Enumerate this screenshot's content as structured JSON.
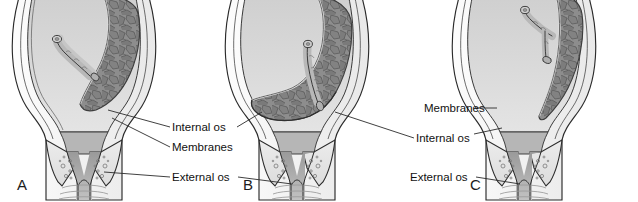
{
  "figure": {
    "background_color": "#ffffff",
    "panels": [
      {
        "letter": "A",
        "name": "low-lying-placenta",
        "placenta_position": "upper right uterine wall, does not reach internal os"
      },
      {
        "letter": "B",
        "name": "partial-placenta-previa",
        "placenta_position": "lower uterine segment, partially covering internal os"
      },
      {
        "letter": "C",
        "name": "marginal-placenta-previa",
        "placenta_position": "right lateral wall, edge near lower segment"
      }
    ],
    "label_groups": [
      {
        "name": "center-labels",
        "labels": [
          {
            "text": "Internal os"
          },
          {
            "text": "Membranes"
          },
          {
            "text": "External os"
          }
        ]
      },
      {
        "name": "right-labels",
        "labels": [
          {
            "text": "Membranes"
          },
          {
            "text": "Internal os"
          },
          {
            "text": "External os"
          }
        ]
      }
    ],
    "colors": {
      "amniotic_cavity": "#d8d8d8",
      "placenta": "#8a8a8a",
      "placenta_outline": "#4a4a4a",
      "myometrium": "#f2f2f2",
      "cervix": "#e3e3e3",
      "cervical_canal": "#a9a9a9",
      "vagina": "#cccccc",
      "outline": "#2b2b2b",
      "label_text": "#111111"
    }
  }
}
